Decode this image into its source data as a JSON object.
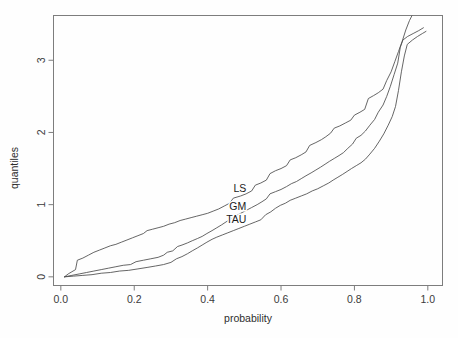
{
  "figure": {
    "background_color": "#fefefe",
    "line_color": "#4a4a4a",
    "axis_color": "#7d7d7d"
  },
  "chart_data": {
    "type": "line",
    "title": "",
    "subtitle": "",
    "xlabel": "probability",
    "ylabel": "quantiles",
    "xlim": [
      -0.02,
      1.04
    ],
    "ylim": [
      -0.12,
      3.62
    ],
    "xticks": [
      0.0,
      0.2,
      0.4,
      0.6,
      0.8,
      1.0
    ],
    "xtick_labels": [
      "0.0",
      "0.2",
      "0.4",
      "0.6",
      "0.8",
      "1.0"
    ],
    "yticks": [
      0,
      1,
      2,
      3
    ],
    "ytick_labels": [
      "0",
      "1",
      "2",
      "3"
    ],
    "grid": false,
    "legend_position": "inline-annotations",
    "annotations": [
      {
        "text": "LS",
        "x": 0.488,
        "y": 1.225
      },
      {
        "text": "GM",
        "x": 0.482,
        "y": 0.985
      },
      {
        "text": "TAU",
        "x": 0.478,
        "y": 0.805
      }
    ],
    "series": [
      {
        "name": "LS",
        "label": "LS",
        "color": "#4a4a4a",
        "points": [
          [
            0.01,
            0.0
          ],
          [
            0.02,
            0.04
          ],
          [
            0.03,
            0.07
          ],
          [
            0.04,
            0.1
          ],
          [
            0.045,
            0.23
          ],
          [
            0.06,
            0.26
          ],
          [
            0.075,
            0.3
          ],
          [
            0.09,
            0.34
          ],
          [
            0.105,
            0.37
          ],
          [
            0.12,
            0.4
          ],
          [
            0.135,
            0.43
          ],
          [
            0.15,
            0.45
          ],
          [
            0.165,
            0.48
          ],
          [
            0.18,
            0.51
          ],
          [
            0.195,
            0.54
          ],
          [
            0.21,
            0.57
          ],
          [
            0.225,
            0.6
          ],
          [
            0.235,
            0.64
          ],
          [
            0.25,
            0.66
          ],
          [
            0.265,
            0.68
          ],
          [
            0.28,
            0.7
          ],
          [
            0.295,
            0.73
          ],
          [
            0.31,
            0.75
          ],
          [
            0.325,
            0.78
          ],
          [
            0.34,
            0.8
          ],
          [
            0.355,
            0.82
          ],
          [
            0.37,
            0.84
          ],
          [
            0.385,
            0.86
          ],
          [
            0.4,
            0.88
          ],
          [
            0.415,
            0.91
          ],
          [
            0.43,
            0.94
          ],
          [
            0.445,
            0.98
          ],
          [
            0.46,
            1.02
          ],
          [
            0.47,
            1.09
          ],
          [
            0.49,
            1.12
          ],
          [
            0.505,
            1.15
          ],
          [
            0.52,
            1.19
          ],
          [
            0.53,
            1.27
          ],
          [
            0.545,
            1.3
          ],
          [
            0.56,
            1.34
          ],
          [
            0.57,
            1.43
          ],
          [
            0.585,
            1.47
          ],
          [
            0.6,
            1.5
          ],
          [
            0.615,
            1.54
          ],
          [
            0.625,
            1.62
          ],
          [
            0.64,
            1.65
          ],
          [
            0.655,
            1.69
          ],
          [
            0.668,
            1.73
          ],
          [
            0.678,
            1.82
          ],
          [
            0.695,
            1.86
          ],
          [
            0.71,
            1.9
          ],
          [
            0.722,
            1.94
          ],
          [
            0.735,
            1.99
          ],
          [
            0.745,
            2.06
          ],
          [
            0.76,
            2.09
          ],
          [
            0.775,
            2.13
          ],
          [
            0.79,
            2.17
          ],
          [
            0.8,
            2.24
          ],
          [
            0.815,
            2.28
          ],
          [
            0.828,
            2.32
          ],
          [
            0.838,
            2.47
          ],
          [
            0.852,
            2.51
          ],
          [
            0.865,
            2.55
          ],
          [
            0.878,
            2.6
          ],
          [
            0.888,
            2.72
          ],
          [
            0.9,
            2.84
          ],
          [
            0.91,
            2.98
          ],
          [
            0.92,
            3.12
          ],
          [
            0.93,
            3.26
          ],
          [
            0.94,
            3.42
          ],
          [
            0.95,
            3.55
          ],
          [
            0.957,
            3.62
          ]
        ]
      },
      {
        "name": "GM",
        "label": "GM",
        "color": "#4a4a4a",
        "points": [
          [
            0.01,
            0.0
          ],
          [
            0.03,
            0.02
          ],
          [
            0.05,
            0.04
          ],
          [
            0.07,
            0.06
          ],
          [
            0.09,
            0.08
          ],
          [
            0.11,
            0.1
          ],
          [
            0.13,
            0.12
          ],
          [
            0.15,
            0.14
          ],
          [
            0.17,
            0.16
          ],
          [
            0.19,
            0.17
          ],
          [
            0.205,
            0.21
          ],
          [
            0.225,
            0.23
          ],
          [
            0.245,
            0.25
          ],
          [
            0.265,
            0.27
          ],
          [
            0.28,
            0.3
          ],
          [
            0.29,
            0.34
          ],
          [
            0.305,
            0.36
          ],
          [
            0.318,
            0.42
          ],
          [
            0.33,
            0.44
          ],
          [
            0.345,
            0.47
          ],
          [
            0.358,
            0.5
          ],
          [
            0.372,
            0.53
          ],
          [
            0.385,
            0.56
          ],
          [
            0.398,
            0.6
          ],
          [
            0.412,
            0.64
          ],
          [
            0.425,
            0.68
          ],
          [
            0.438,
            0.72
          ],
          [
            0.45,
            0.76
          ],
          [
            0.462,
            0.8
          ],
          [
            0.475,
            0.84
          ],
          [
            0.49,
            0.88
          ],
          [
            0.505,
            0.92
          ],
          [
            0.52,
            0.96
          ],
          [
            0.535,
            1.0
          ],
          [
            0.548,
            1.04
          ],
          [
            0.56,
            1.08
          ],
          [
            0.57,
            1.15
          ],
          [
            0.585,
            1.18
          ],
          [
            0.6,
            1.21
          ],
          [
            0.615,
            1.25
          ],
          [
            0.628,
            1.29
          ],
          [
            0.642,
            1.32
          ],
          [
            0.655,
            1.36
          ],
          [
            0.668,
            1.4
          ],
          [
            0.682,
            1.44
          ],
          [
            0.695,
            1.48
          ],
          [
            0.708,
            1.52
          ],
          [
            0.72,
            1.56
          ],
          [
            0.732,
            1.6
          ],
          [
            0.745,
            1.64
          ],
          [
            0.758,
            1.68
          ],
          [
            0.77,
            1.72
          ],
          [
            0.782,
            1.78
          ],
          [
            0.795,
            1.84
          ],
          [
            0.805,
            1.92
          ],
          [
            0.818,
            1.96
          ],
          [
            0.83,
            2.02
          ],
          [
            0.842,
            2.1
          ],
          [
            0.855,
            2.18
          ],
          [
            0.865,
            2.28
          ],
          [
            0.878,
            2.38
          ],
          [
            0.888,
            2.5
          ],
          [
            0.898,
            2.64
          ],
          [
            0.908,
            2.8
          ],
          [
            0.918,
            2.96
          ],
          [
            0.925,
            3.18
          ],
          [
            0.932,
            3.28
          ],
          [
            0.945,
            3.33
          ],
          [
            0.96,
            3.37
          ],
          [
            0.975,
            3.41
          ],
          [
            0.988,
            3.45
          ]
        ]
      },
      {
        "name": "TAU",
        "label": "TAU",
        "color": "#4a4a4a",
        "points": [
          [
            0.01,
            0.0
          ],
          [
            0.035,
            0.01
          ],
          [
            0.06,
            0.02
          ],
          [
            0.085,
            0.03
          ],
          [
            0.11,
            0.05
          ],
          [
            0.135,
            0.06
          ],
          [
            0.16,
            0.08
          ],
          [
            0.185,
            0.09
          ],
          [
            0.21,
            0.11
          ],
          [
            0.235,
            0.13
          ],
          [
            0.258,
            0.15
          ],
          [
            0.28,
            0.17
          ],
          [
            0.3,
            0.2
          ],
          [
            0.315,
            0.25
          ],
          [
            0.33,
            0.28
          ],
          [
            0.345,
            0.32
          ],
          [
            0.358,
            0.36
          ],
          [
            0.372,
            0.4
          ],
          [
            0.385,
            0.44
          ],
          [
            0.398,
            0.48
          ],
          [
            0.412,
            0.52
          ],
          [
            0.425,
            0.55
          ],
          [
            0.44,
            0.58
          ],
          [
            0.455,
            0.61
          ],
          [
            0.47,
            0.64
          ],
          [
            0.485,
            0.67
          ],
          [
            0.5,
            0.7
          ],
          [
            0.515,
            0.73
          ],
          [
            0.53,
            0.76
          ],
          [
            0.545,
            0.79
          ],
          [
            0.558,
            0.86
          ],
          [
            0.572,
            0.9
          ],
          [
            0.585,
            0.95
          ],
          [
            0.598,
            0.99
          ],
          [
            0.612,
            1.02
          ],
          [
            0.625,
            1.06
          ],
          [
            0.64,
            1.09
          ],
          [
            0.655,
            1.12
          ],
          [
            0.67,
            1.15
          ],
          [
            0.685,
            1.19
          ],
          [
            0.7,
            1.22
          ],
          [
            0.715,
            1.26
          ],
          [
            0.73,
            1.3
          ],
          [
            0.742,
            1.34
          ],
          [
            0.755,
            1.38
          ],
          [
            0.768,
            1.42
          ],
          [
            0.78,
            1.46
          ],
          [
            0.792,
            1.5
          ],
          [
            0.805,
            1.54
          ],
          [
            0.818,
            1.58
          ],
          [
            0.83,
            1.63
          ],
          [
            0.842,
            1.7
          ],
          [
            0.855,
            1.78
          ],
          [
            0.868,
            1.88
          ],
          [
            0.88,
            1.98
          ],
          [
            0.892,
            2.1
          ],
          [
            0.903,
            2.22
          ],
          [
            0.912,
            2.36
          ],
          [
            0.92,
            2.58
          ],
          [
            0.928,
            2.84
          ],
          [
            0.936,
            3.06
          ],
          [
            0.944,
            3.22
          ],
          [
            0.958,
            3.28
          ],
          [
            0.972,
            3.33
          ],
          [
            0.985,
            3.37
          ],
          [
            0.995,
            3.4
          ]
        ]
      }
    ]
  }
}
